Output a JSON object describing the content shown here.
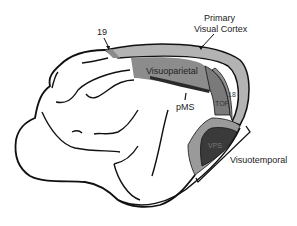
{
  "diagram": {
    "type": "brain-lateral-view",
    "labels": {
      "area19": "19",
      "primary_visual_cortex_line1": "Primary",
      "primary_visual_cortex_line2": "Visual Cortex",
      "visuoparietal": "Visuoparietal",
      "pms": "pMS",
      "area18": "18",
      "top": "TOP",
      "vps": "VPS",
      "visuotemporal": "Visuotemporal"
    },
    "colors": {
      "outline": "#111111",
      "primary_visual_cortex": "#b3b3b3",
      "area19_band": "#8a8a8a",
      "visuoparietal": "#8c8c8c",
      "top_region": "#7a7a7a",
      "area18": "#909090",
      "visuotemporal_outer": "#9a9a9a",
      "vps": "#3a3a3a",
      "pms_band": "#2a2a2a",
      "background": "#ffffff"
    }
  }
}
